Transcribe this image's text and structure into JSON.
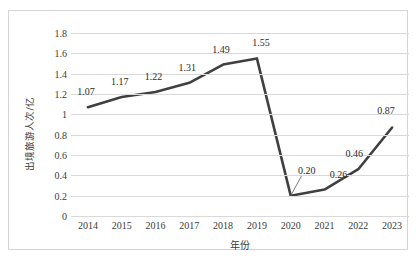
{
  "chart_data": {
    "type": "line",
    "title": "",
    "xlabel": "年份",
    "ylabel": "出境旅游人次/亿",
    "categories": [
      "2014",
      "2015",
      "2016",
      "2017",
      "2018",
      "2019",
      "2020",
      "2021",
      "2022",
      "2023"
    ],
    "values": [
      1.07,
      1.17,
      1.22,
      1.31,
      1.49,
      1.55,
      0.2,
      0.26,
      0.46,
      0.87
    ],
    "data_labels": [
      "1.07",
      "1.17",
      "1.22",
      "1.31",
      "1.49",
      "1.55",
      "0.20",
      "0.26",
      "0.46",
      "0.87"
    ],
    "ylim": [
      0,
      1.8
    ],
    "yticks": [
      0,
      0.2,
      0.4,
      0.6,
      0.8,
      1.0,
      1.2,
      1.4,
      1.6,
      1.8
    ],
    "ytick_labels": [
      "0",
      "0.2",
      "0.4",
      "0.6",
      "0.8",
      "1",
      "1.2",
      "1.4",
      "1.6",
      "1.8"
    ],
    "grid": true,
    "legend": "none",
    "series": [
      {
        "name": "出境旅游人次/亿",
        "values": [
          1.07,
          1.17,
          1.22,
          1.31,
          1.49,
          1.55,
          0.2,
          0.26,
          0.46,
          0.87
        ]
      }
    ],
    "colors": {
      "line": "#404040",
      "grid": "#d9d9d9",
      "frame": "#d4d4d4",
      "text": "#3c3c3c",
      "background": "#ffffff"
    }
  }
}
